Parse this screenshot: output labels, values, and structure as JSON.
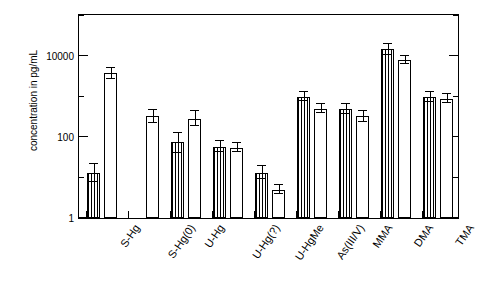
{
  "chart_data": {
    "type": "bar",
    "title": "",
    "xlabel": "",
    "ylabel": "concentration in pg/mL",
    "yscale": "log",
    "ylim": [
      1,
      100000
    ],
    "ytick_labels": [
      "1",
      "100",
      "10000"
    ],
    "ytick_values": [
      1,
      100,
      10000
    ],
    "grid": false,
    "legend": false,
    "categories": [
      "S-Hg",
      "S-Hg(0)",
      "U-Hg",
      "U-Hg(?)",
      "U-HgMe",
      "As(III/V)",
      "MMA",
      "DMA",
      "TMA"
    ],
    "series": [
      {
        "name": "hatched",
        "pattern": "vertical-lines",
        "values": [
          13,
          null,
          75,
          58,
          13,
          1000,
          500,
          15000,
          1000
        ],
        "err_low": [
          8,
          null,
          40,
          42,
          9,
          800,
          380,
          11000,
          750
        ],
        "err_high": [
          22,
          null,
          130,
          80,
          19,
          1300,
          660,
          20000,
          1350
        ]
      },
      {
        "name": "open",
        "pattern": "open",
        "values": [
          3800,
          330,
          290,
          55,
          5,
          500,
          330,
          8000,
          900
        ],
        "err_low": [
          2800,
          230,
          190,
          42,
          4,
          390,
          240,
          6500,
          700
        ],
        "err_high": [
          5200,
          470,
          440,
          72,
          6.5,
          650,
          450,
          10000,
          1150
        ]
      }
    ]
  }
}
